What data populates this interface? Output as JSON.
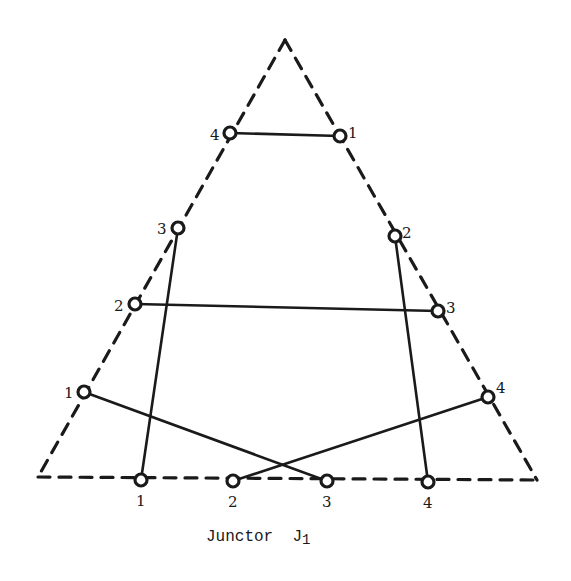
{
  "caption": {
    "text": "Junctor  J",
    "subscript": "1"
  },
  "colors": {
    "stroke": "#1a1a1a",
    "background": "#ffffff"
  },
  "triangle": {
    "style": "dashed",
    "apex": [
      285,
      40
    ],
    "bottom_left": [
      38,
      477
    ],
    "bottom_right": [
      537,
      480
    ]
  },
  "nodes": [
    {
      "id": "L1",
      "side": "left",
      "label": "1",
      "x": 84,
      "y": 392,
      "lx": 64,
      "ly": 398
    },
    {
      "id": "L2",
      "side": "left",
      "label": "2",
      "x": 135,
      "y": 304,
      "lx": 114,
      "ly": 311
    },
    {
      "id": "L3",
      "side": "left",
      "label": "3",
      "x": 178,
      "y": 228,
      "lx": 157,
      "ly": 234
    },
    {
      "id": "L4",
      "side": "left",
      "label": "4",
      "x": 230,
      "y": 133,
      "lx": 210,
      "ly": 140
    },
    {
      "id": "R1",
      "side": "right",
      "label": "1",
      "x": 340,
      "y": 136,
      "lx": 348,
      "ly": 138
    },
    {
      "id": "R2",
      "side": "right",
      "label": "2",
      "x": 395,
      "y": 236,
      "lx": 402,
      "ly": 238
    },
    {
      "id": "R3",
      "side": "right",
      "label": "3",
      "x": 438,
      "y": 311,
      "lx": 446,
      "ly": 313
    },
    {
      "id": "R4",
      "side": "right",
      "label": "4",
      "x": 488,
      "y": 397,
      "lx": 496,
      "ly": 393
    },
    {
      "id": "B1",
      "side": "bottom",
      "label": "1",
      "x": 141,
      "y": 480,
      "lx": 136,
      "ly": 506
    },
    {
      "id": "B2",
      "side": "bottom",
      "label": "2",
      "x": 233,
      "y": 481,
      "lx": 228,
      "ly": 507
    },
    {
      "id": "B3",
      "side": "bottom",
      "label": "3",
      "x": 327,
      "y": 481,
      "lx": 322,
      "ly": 507
    },
    {
      "id": "B4",
      "side": "bottom",
      "label": "4",
      "x": 428,
      "y": 482,
      "lx": 423,
      "ly": 508
    }
  ],
  "edges": [
    {
      "from": "L4",
      "to": "R1"
    },
    {
      "from": "L3",
      "to": "B1"
    },
    {
      "from": "R2",
      "to": "B4"
    },
    {
      "from": "L2",
      "to": "R3"
    },
    {
      "from": "L1",
      "to": "B3"
    },
    {
      "from": "R4",
      "to": "B2"
    }
  ]
}
